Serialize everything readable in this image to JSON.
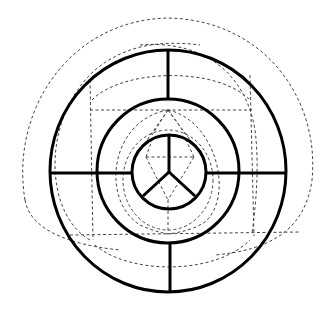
{
  "diagram": {
    "title": "",
    "colors": {
      "background": "#ffffff",
      "solid_stroke": "#000000",
      "dashed_stroke": "#444444"
    },
    "center": {
      "x": 168,
      "y": 172
    },
    "solid_circles": [
      {
        "name": "outer-ring",
        "rx": 118,
        "ry": 121
      },
      {
        "name": "middle-ring",
        "rx": 71,
        "ry": 72
      },
      {
        "name": "inner-ring",
        "rx": 37,
        "ry": 37
      }
    ],
    "spokes": {
      "outer_band": [
        "top",
        "bottom",
        "left",
        "right"
      ],
      "inner_circle_y_junction": [
        "up",
        "lower-left",
        "lower-right"
      ]
    },
    "dashed_lines": {
      "upper_horizontal_y": 110,
      "lower_horizontal_y": 234,
      "left_vertical_x": 90,
      "right_vertical_x": 252
    },
    "labels": []
  }
}
